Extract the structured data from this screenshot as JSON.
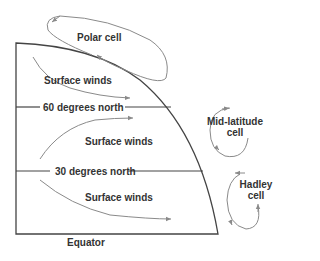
{
  "diagram": {
    "labels": {
      "polar_cell": "Polar cell",
      "mid_latitude_cell_line1": "Mid-latitude",
      "mid_latitude_cell_line2": "cell",
      "hadley_cell_line1": "Hadley",
      "hadley_cell_line2": "cell",
      "surface_winds_polar": "Surface winds",
      "surface_winds_mid": "Surface winds",
      "surface_winds_tropical": "Surface winds",
      "lat_60": "60 degrees north",
      "lat_30": "30 degrees north",
      "equator": "Equator"
    },
    "colors": {
      "outline": "#444444",
      "arrows": "#8a8a8a",
      "text": "#333333",
      "background": "#ffffff"
    }
  }
}
